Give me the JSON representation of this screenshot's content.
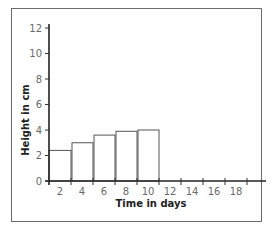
{
  "chart_data": {
    "type": "bar",
    "title": "",
    "xlabel": "Time in days",
    "ylabel": "Height in cm",
    "categories": [
      "2",
      "4",
      "6",
      "8",
      "10",
      "12",
      "14",
      "16",
      "18"
    ],
    "values": [
      2.4,
      3.0,
      3.6,
      3.9,
      4.0,
      null,
      null,
      null,
      null
    ],
    "xticks": [
      "2",
      "4",
      "6",
      "8",
      "10",
      "12",
      "14",
      "16",
      "18"
    ],
    "yticks": [
      "0",
      "2",
      "4",
      "6",
      "8",
      "10",
      "12"
    ],
    "ylim": [
      0,
      12.5
    ],
    "grid": false,
    "legend": null,
    "bar_fill": "#ffffff",
    "bar_stroke": "#555555"
  }
}
